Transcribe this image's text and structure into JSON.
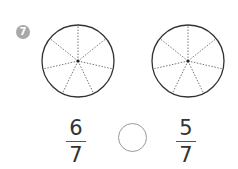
{
  "problem": {
    "number": "7",
    "pies": [
      {
        "segments": 7,
        "label": "left-pie"
      },
      {
        "segments": 7,
        "label": "right-pie"
      }
    ],
    "left_fraction": {
      "numerator": "6",
      "denominator": "7"
    },
    "right_fraction": {
      "numerator": "5",
      "denominator": "7"
    },
    "comparison_symbol": ""
  }
}
